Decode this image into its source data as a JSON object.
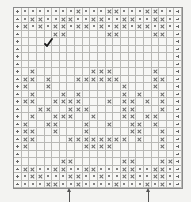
{
  "chart_data": {
    "type": "table",
    "title": "",
    "columns": 22,
    "rows": 24,
    "legend": {
      ".": "empty",
      "x": "cross",
      "o": "dot",
      "p": "plus (edge marker)"
    },
    "grid": [
      "poooooooxoooxxoooxxoop",
      "poxxooxxooxxooxxooxxop",
      "pxoxoxxoxxoxoxxoxxoxop",
      "p....xx.....xx....xx.p",
      "p....................p",
      "p....................p",
      "p....................p",
      "p....................p",
      "p.x.......xxx.....x..p",
      "pxx.x...xxxxxx....xx.p",
      "px..x.........x...x..p",
      "p.x...x.x.....x.x..x.p",
      "pxx..xxxx...x.xx.x.x.p",
      "p..xx..xxx....xx...x.p",
      "p.x..xxx..x...xx.xx..p",
      "px..xx...x..x..xx.x..p",
      "pxx..x...x.....xx..x.p",
      "pxx....xxxxxxxx.x..x.p",
      "px.......xxxx......x.p",
      "p....................p",
      "p.....xx......xx...xxp",
      "pxxooxxooxxoooxxooxxop",
      "poxxoooxxooxooxxooxxop",
      "poooxxooxooooxoooxoxop"
    ],
    "markers": {
      "checkmark": {
        "row": 4,
        "col": 4
      },
      "arrows": [
        {
          "x_px": 69,
          "label": "up-arrow"
        },
        {
          "x_px": 148,
          "label": "up-arrow"
        }
      ]
    }
  },
  "annotations": {
    "check_symbol": "✓"
  }
}
